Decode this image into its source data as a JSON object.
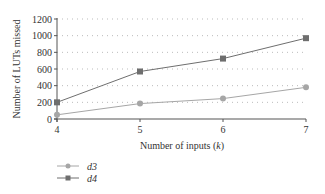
{
  "chart_data": {
    "type": "line",
    "title": "",
    "xlabel": "Number of inputs (k)",
    "xlabel_prefix": "Number of inputs (",
    "xlabel_var": "k",
    "xlabel_suffix": ")",
    "ylabel": "Number of LUTs missed",
    "x": [
      4,
      5,
      6,
      7
    ],
    "x_ticks": [
      "4",
      "5",
      "6",
      "7"
    ],
    "y_ticks": [
      0,
      200,
      400,
      600,
      800,
      1000,
      1200
    ],
    "ylim": [
      0,
      1200
    ],
    "grid": "horizontal dotted",
    "legend_position": "bottom-left",
    "series": [
      {
        "name": "d3",
        "marker": "circle",
        "color": "#a6a6a6",
        "values": [
          50,
          185,
          245,
          380
        ]
      },
      {
        "name": "d4",
        "marker": "square",
        "color": "#6e6e6e",
        "values": [
          200,
          570,
          725,
          970
        ]
      }
    ]
  },
  "legend": {
    "items": [
      {
        "label": "d3"
      },
      {
        "label": "d4"
      }
    ]
  }
}
